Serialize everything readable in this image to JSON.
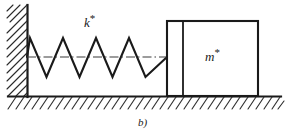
{
  "figure": {
    "caption": "b)",
    "labels": {
      "spring_label_base": "k",
      "spring_label_sup": "*",
      "mass_label_base": "m",
      "mass_label_sup": "*"
    },
    "colors": {
      "ink": "#1a1a1a",
      "background": "#ffffff",
      "hatch": "#2b2b2b",
      "centerline": "#3a3a3a"
    },
    "geometry": {
      "wall": {
        "x": 27,
        "y_top": 5,
        "y_bottom": 96,
        "hatch_count": 11,
        "hatch_direction": "upper-left-to-lower-right"
      },
      "ground": {
        "y": 96,
        "x_start": 8,
        "x_end": 281,
        "hatch_count": 34,
        "hatch_direction": "upper-right-to-lower-left"
      },
      "spring": {
        "x_start": 27,
        "x_end": 167,
        "y_center": 57,
        "amplitude": 19,
        "peaks_x": [
          30,
          63,
          96,
          129
        ],
        "valleys_x": [
          46.5,
          79.5,
          112.5,
          145.5
        ],
        "period": 33
      },
      "centerline": {
        "x_start": 27,
        "x_end": 167,
        "y": 57,
        "style": "dash-dot"
      },
      "block": {
        "x_left": 167,
        "x_right": 258,
        "y_top": 21,
        "y_bottom": 96,
        "inner_divider_x": 183
      }
    }
  }
}
